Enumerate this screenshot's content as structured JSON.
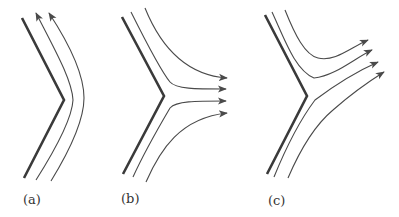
{
  "figure": {
    "panels": [
      {
        "id": "a",
        "label": "(a)",
        "description": "Flow along a convex corner; two streamlines follow the wall upward"
      },
      {
        "id": "b",
        "label": "(b)",
        "description": "Flow separating at a corner; four streamlines turn horizontally to the right"
      },
      {
        "id": "c",
        "label": "(c)",
        "description": "Flow separating at a corner; four streamlines turn upward-right"
      }
    ]
  },
  "colors": {
    "wall": "#3a3a3a",
    "streamline": "#4a4a4a",
    "background": "#ffffff"
  }
}
